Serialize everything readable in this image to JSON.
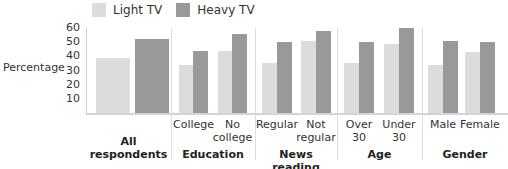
{
  "legend": [
    {
      "label": "Light TV",
      "color": "#dcdcdc"
    },
    {
      "label": "Heavy TV",
      "color": "#999999"
    }
  ],
  "colors": {
    "light": "#dcdcdc",
    "heavy": "#999999",
    "axis": "#cfcfcf"
  },
  "chart_data": {
    "type": "bar",
    "title": "",
    "xlabel": "",
    "ylabel": "Percentage",
    "ylim": [
      0,
      60
    ],
    "yticks": [
      10,
      20,
      30,
      40,
      50,
      60
    ],
    "grid": false,
    "legend_position": "top",
    "groups": [
      {
        "label": "All respondents",
        "categories": [
          ""
        ]
      },
      {
        "label": "Education",
        "categories": [
          "College",
          "No college"
        ]
      },
      {
        "label": "News reading",
        "categories": [
          "Regular",
          "Not regular"
        ]
      },
      {
        "label": "Age",
        "categories": [
          "Over 30",
          "Under 30"
        ]
      },
      {
        "label": "Gender",
        "categories": [
          "Male",
          "Female"
        ]
      }
    ],
    "categories": [
      "All respondents",
      "College",
      "No college",
      "Regular",
      "Not regular",
      "Over 30",
      "Under 30",
      "Male",
      "Female"
    ],
    "series": [
      {
        "name": "Light TV",
        "values": [
          39,
          34,
          44,
          35,
          51,
          35,
          49,
          34,
          43
        ]
      },
      {
        "name": "Heavy TV",
        "values": [
          52,
          44,
          56,
          50,
          58,
          50,
          60,
          51,
          50
        ]
      }
    ]
  },
  "labels": {
    "ylabel": "Percentage",
    "yticks": [
      "60",
      "50",
      "40",
      "30",
      "20",
      "10"
    ],
    "groups": [
      {
        "line1": "All",
        "line2": "respondents"
      },
      {
        "line1": "Education"
      },
      {
        "line1": "News reading"
      },
      {
        "line1": "Age"
      },
      {
        "line1": "Gender"
      }
    ],
    "subcategories": [
      {
        "line1": "College",
        "line2": ""
      },
      {
        "line1": "No",
        "line2": "college"
      },
      {
        "line1": "Regular",
        "line2": ""
      },
      {
        "line1": "Not",
        "line2": "regular"
      },
      {
        "line1": "Over",
        "line2": "30"
      },
      {
        "line1": "Under",
        "line2": "30"
      },
      {
        "line1": "Male",
        "line2": ""
      },
      {
        "line1": "Female",
        "line2": ""
      }
    ]
  }
}
